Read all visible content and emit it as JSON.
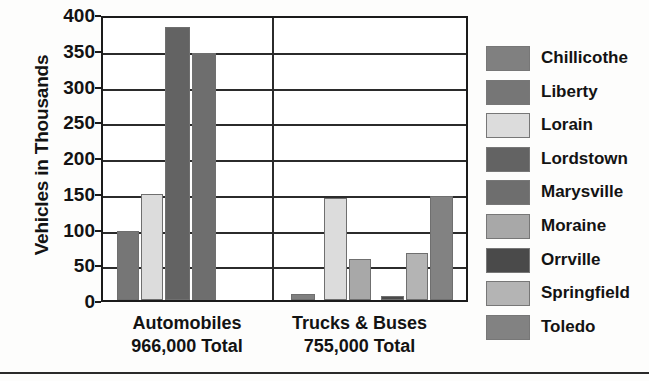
{
  "chart_data": {
    "type": "bar",
    "title": "",
    "xlabel": "",
    "ylabel": "Vehicles in Thousands",
    "ylim": [
      0,
      400
    ],
    "yticks": [
      0,
      50,
      100,
      150,
      200,
      250,
      300,
      350,
      400
    ],
    "grid": true,
    "legend_position": "right",
    "categories": [
      "Automobiles",
      "Trucks & Buses"
    ],
    "category_sublabels": [
      "966,000 Total",
      "755,000 Total"
    ],
    "series": [
      {
        "name": "Chillicothe",
        "color": "#808080",
        "values": [
          0,
          8
        ]
      },
      {
        "name": "Liberty",
        "color": "#767676",
        "values": [
          96,
          0
        ]
      },
      {
        "name": "Lorain",
        "color": "#dcdcdc",
        "values": [
          148,
          142
        ]
      },
      {
        "name": "Lordstown",
        "color": "#636363",
        "values": [
          382,
          0
        ]
      },
      {
        "name": "Marysville",
        "color": "#6e6e6e",
        "values": [
          345,
          0
        ]
      },
      {
        "name": "Moraine",
        "color": "#a8a8a8",
        "values": [
          0,
          57
        ]
      },
      {
        "name": "Orrville",
        "color": "#4a4a4a",
        "values": [
          0,
          5
        ]
      },
      {
        "name": "Springfield",
        "color": "#b4b4b4",
        "values": [
          0,
          66
        ]
      },
      {
        "name": "Toledo",
        "color": "#828282",
        "values": [
          0,
          146
        ]
      }
    ],
    "annotations": []
  },
  "axis": {
    "tick_labels": [
      "400",
      "350",
      "300",
      "250",
      "200",
      "150",
      "100",
      "50",
      "0"
    ],
    "y_title": "Vehicles in Thousands"
  },
  "categories": [
    {
      "label": "Automobiles",
      "sublabel": "966,000 Total"
    },
    {
      "label": "Trucks & Buses",
      "sublabel": "755,000 Total"
    }
  ],
  "legend": {
    "items": [
      {
        "label": "Chillicothe",
        "color": "#808080"
      },
      {
        "label": "Liberty",
        "color": "#767676"
      },
      {
        "label": "Lorain",
        "color": "#dcdcdc"
      },
      {
        "label": "Lordstown",
        "color": "#636363"
      },
      {
        "label": "Marysville",
        "color": "#6e6e6e"
      },
      {
        "label": "Moraine",
        "color": "#a8a8a8"
      },
      {
        "label": "Orrville",
        "color": "#4a4a4a"
      },
      {
        "label": "Springfield",
        "color": "#b4b4b4"
      },
      {
        "label": "Toledo",
        "color": "#828282"
      }
    ]
  },
  "bars": [
    {
      "series": "Liberty",
      "group": 0,
      "value": 96,
      "color": "#767676",
      "left": 14,
      "width": 22
    },
    {
      "series": "Lorain",
      "group": 0,
      "value": 148,
      "color": "#dcdcdc",
      "left": 38,
      "width": 22
    },
    {
      "series": "Lordstown",
      "group": 0,
      "value": 382,
      "color": "#636363",
      "left": 62,
      "width": 25
    },
    {
      "series": "Marysville",
      "group": 0,
      "value": 345,
      "color": "#6e6e6e",
      "left": 89,
      "width": 24
    },
    {
      "series": "Chillicothe",
      "group": 1,
      "value": 8,
      "color": "#808080",
      "left": 188,
      "width": 24
    },
    {
      "series": "Lorain",
      "group": 1,
      "value": 142,
      "color": "#dcdcdc",
      "left": 221,
      "width": 23
    },
    {
      "series": "Moraine",
      "group": 1,
      "value": 57,
      "color": "#a8a8a8",
      "left": 246,
      "width": 22
    },
    {
      "series": "Orrville",
      "group": 1,
      "value": 5,
      "color": "#4a4a4a",
      "left": 278,
      "width": 23
    },
    {
      "series": "Springfield",
      "group": 1,
      "value": 66,
      "color": "#b4b4b4",
      "left": 303,
      "width": 22
    },
    {
      "series": "Toledo",
      "group": 1,
      "value": 146,
      "color": "#828282",
      "left": 327,
      "width": 23
    }
  ]
}
